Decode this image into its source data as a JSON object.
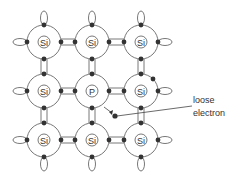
{
  "diagram": {
    "title": "",
    "atoms": [
      {
        "row": 0,
        "col": 0,
        "symbol": "Si"
      },
      {
        "row": 0,
        "col": 1,
        "symbol": "Si"
      },
      {
        "row": 0,
        "col": 2,
        "symbol": "Si"
      },
      {
        "row": 1,
        "col": 0,
        "symbol": "Si"
      },
      {
        "row": 1,
        "col": 1,
        "symbol": "P"
      },
      {
        "row": 1,
        "col": 2,
        "symbol": "Si"
      },
      {
        "row": 2,
        "col": 0,
        "symbol": "Si"
      },
      {
        "row": 2,
        "col": 1,
        "symbol": "Si"
      },
      {
        "row": 2,
        "col": 2,
        "symbol": "Si"
      }
    ],
    "annotation": {
      "line1": "loose",
      "line2": "electron"
    },
    "colors": {
      "line": "#555555",
      "electron": "#333333",
      "text": "#333333"
    }
  }
}
